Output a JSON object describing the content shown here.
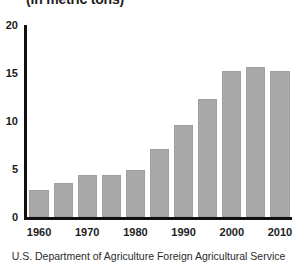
{
  "chart_data": {
    "type": "bar",
    "title": "(in metric tons)",
    "subtitle": "",
    "xlabel": "",
    "ylabel": "",
    "source": "U.S. Department of Agriculture Foreign Agricultural Service",
    "grid": false,
    "legend": false,
    "legend_position": "none",
    "bar_color": "#a9a9a9",
    "axis_color": "#111111",
    "ylim": [
      0,
      20
    ],
    "yticks": [
      0,
      5,
      10,
      15,
      20
    ],
    "ytick_labels": [
      "0",
      "5",
      "10",
      "15",
      "20"
    ],
    "xtick_labels": [
      "1960",
      "1970",
      "1980",
      "1990",
      "2000",
      "2010"
    ],
    "categories": [
      "1960",
      "1965",
      "1970",
      "1975",
      "1980",
      "1985",
      "1990",
      "1995",
      "2000",
      "2005",
      "2010"
    ],
    "values": [
      2.8,
      3.5,
      4.4,
      4.4,
      4.9,
      7.1,
      9.6,
      12.3,
      15.2,
      15.6,
      15.2
    ]
  }
}
